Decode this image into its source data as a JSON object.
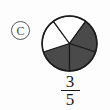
{
  "label": {
    "text": "C",
    "shape": "circled-letter"
  },
  "fraction": {
    "numerator": "3",
    "denominator": "5",
    "display": "3/5"
  },
  "colors": {
    "shaded": "#4a4a4a",
    "unshaded": "#ffffff",
    "outline": "#1c1c1c",
    "text": "#1a1a1a",
    "badge_outline": "#5a5a5a"
  },
  "chart_data": {
    "type": "pie",
    "title": "",
    "total_slices": 5,
    "shaded_slices": 3,
    "unshaded_slices": 2,
    "slice_angle_degrees": 72,
    "value": 0.6,
    "categories": [
      "slice 1",
      "slice 2",
      "slice 3",
      "slice 4",
      "slice 5"
    ],
    "values": [
      72,
      72,
      72,
      72,
      72
    ],
    "slices": [
      {
        "name": "slice 1",
        "start_angle": 90,
        "end_angle": 162,
        "shaded": true
      },
      {
        "name": "slice 2",
        "start_angle": 162,
        "end_angle": 234,
        "shaded": false
      },
      {
        "name": "slice 3",
        "start_angle": 234,
        "end_angle": 306,
        "shaded": false
      },
      {
        "name": "slice 4",
        "start_angle": 306,
        "end_angle": 18,
        "shaded": true
      },
      {
        "name": "slice 5",
        "start_angle": 18,
        "end_angle": 90,
        "shaded": true
      }
    ],
    "legend": [],
    "grid": false,
    "xlabel": "",
    "ylabel": ""
  }
}
